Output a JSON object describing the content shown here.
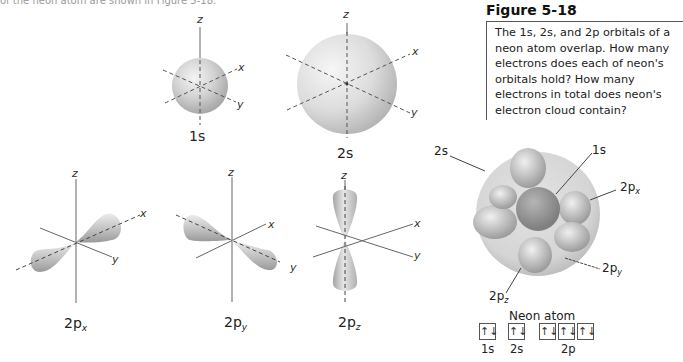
{
  "figure": {
    "title": "Figure 5-18",
    "caption": "The 1s, 2s, and 2p orbitals of a neon atom overlap. How many electrons does each of neon's orbitals hold? How many electrons in total does neon's electron cloud contain?"
  },
  "top_text_fragment": "of the neon atom are shown in Figure 5-18.",
  "axes": {
    "x": "x",
    "y": "y",
    "z": "z"
  },
  "orbitals": [
    {
      "id": "1s",
      "label": "1s",
      "sub": ""
    },
    {
      "id": "2s",
      "label": "2s",
      "sub": ""
    },
    {
      "id": "2px",
      "label": "2p",
      "sub": "x"
    },
    {
      "id": "2py",
      "label": "2p",
      "sub": "y"
    },
    {
      "id": "2pz",
      "label": "2p",
      "sub": "z"
    }
  ],
  "neon_diagram": {
    "callouts": [
      {
        "id": "2s",
        "label": "2s",
        "sub": ""
      },
      {
        "id": "1s",
        "label": "1s",
        "sub": ""
      },
      {
        "id": "2px",
        "label": "2p",
        "sub": "x"
      },
      {
        "id": "2py",
        "label": "2p",
        "sub": "y"
      },
      {
        "id": "2pz",
        "label": "2p",
        "sub": "z"
      }
    ],
    "config_title": "Neon atom",
    "boxes": [
      "↑↓",
      "↑↓",
      "↑↓",
      "↑↓",
      "↑↓"
    ],
    "box_labels": [
      "1s",
      "2s",
      "2p"
    ]
  }
}
